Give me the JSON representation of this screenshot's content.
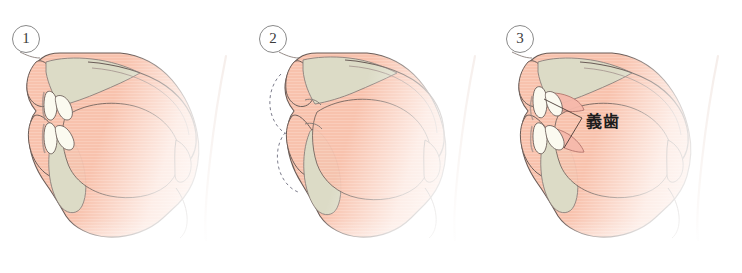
{
  "figure": {
    "width": 742,
    "height": 273,
    "background_color": "#ffffff"
  },
  "palette": {
    "soft_tissue_fill": "#f8c2ad",
    "soft_tissue_fill_light": "#fbdacb",
    "bone_fill": "#dcdbc6",
    "tooth_fill": "#fbfaf0",
    "outline_stroke": "#6b5d58",
    "thin_stroke": "#8a7f7a",
    "dashed_stroke": "#7d7d8c",
    "leader_line": "#4a3b36",
    "number_circle_stroke": "#8a8a8a",
    "label_text": "#1d1d1d"
  },
  "panels": [
    {
      "id": "panel-1",
      "number": "①",
      "number_plain": "1",
      "caption_state": "natural dentition present",
      "has_dashed_outline": false,
      "has_denture": false,
      "label": null
    },
    {
      "id": "panel-2",
      "number": "②",
      "number_plain": "2",
      "caption_state": "edentulous, collapsed profile with dashed former contour",
      "has_dashed_outline": true,
      "has_denture": false,
      "label": null
    },
    {
      "id": "panel-3",
      "number": "③",
      "number_plain": "3",
      "caption_state": "profile restored with complete dentures",
      "has_dashed_outline": false,
      "has_denture": true,
      "label": "義歯"
    }
  ],
  "annotations": {
    "denture_label": "義歯",
    "denture_label_reading": "gishi"
  }
}
